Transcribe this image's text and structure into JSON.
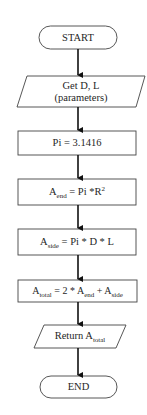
{
  "diagram": {
    "type": "flowchart",
    "nodes": [
      {
        "id": "start",
        "shape": "terminator",
        "text": "START"
      },
      {
        "id": "input",
        "shape": "parallelogram",
        "line1": "Get D, L",
        "line2": "(parameters)"
      },
      {
        "id": "pi",
        "shape": "process",
        "text": "Pi = 3.1416"
      },
      {
        "id": "aend",
        "shape": "process",
        "var": "A",
        "sub": "end",
        "expr": " = Pi *R",
        "sup": "2"
      },
      {
        "id": "aside",
        "shape": "process",
        "var": "A",
        "sub": "side",
        "expr": " = Pi * D * L"
      },
      {
        "id": "atotal",
        "shape": "process",
        "var": "A",
        "sub": "total",
        "expr1": " = 2 * A",
        "sub2": "end",
        "expr2": " + A",
        "sub3": "side"
      },
      {
        "id": "return",
        "shape": "parallelogram",
        "prefix": "Return A",
        "sub": "total"
      },
      {
        "id": "end",
        "shape": "terminator",
        "text": "END"
      }
    ],
    "edges": [
      [
        "start",
        "input"
      ],
      [
        "input",
        "pi"
      ],
      [
        "pi",
        "aend"
      ],
      [
        "aend",
        "aside"
      ],
      [
        "aside",
        "atotal"
      ],
      [
        "atotal",
        "return"
      ],
      [
        "return",
        "end"
      ]
    ],
    "colors": {
      "stroke": "#333333",
      "arrow": "#111111",
      "background": "#ffffff"
    }
  }
}
